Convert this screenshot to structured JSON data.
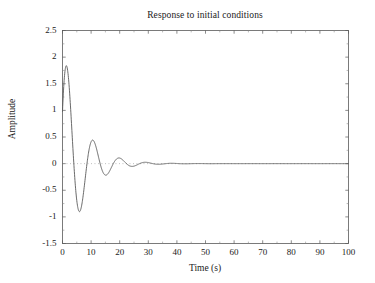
{
  "chart_data": {
    "type": "line",
    "title": "Response to initial conditions",
    "xlabel": "Time (s)",
    "ylabel": "Amplitude",
    "xlim": [
      0,
      100
    ],
    "ylim": [
      -1.5,
      2.5
    ],
    "xticks": [
      0,
      10,
      20,
      30,
      40,
      50,
      60,
      70,
      80,
      90,
      100
    ],
    "xtick_labels": [
      "0",
      "10",
      "20",
      "30",
      "40",
      "50",
      "60",
      "70",
      "80",
      "90",
      "100"
    ],
    "yticks": [
      -1.5,
      -1,
      -0.5,
      0,
      0.5,
      1,
      1.5,
      2,
      2.5
    ],
    "ytick_labels": [
      "-1.5",
      "-1",
      "-0.5",
      "0",
      "0.5",
      "1",
      "1.5",
      "2",
      "2.5"
    ],
    "grid": false,
    "legend": null,
    "zero_line": {
      "value": 0,
      "style": "dotted",
      "color": "#9a9a9a"
    },
    "line_color": "#595959",
    "line_width": 0.9,
    "background": "#ffffff",
    "series": [
      {
        "name": "response",
        "model": "damped-sinusoid",
        "amplitude": 2.32,
        "decay_rate": 0.155,
        "period": 9.2,
        "phase_deg": 25,
        "x": [
          0,
          1,
          2,
          3,
          4,
          5,
          6,
          7,
          8,
          9,
          10,
          11,
          12,
          13,
          14,
          15,
          16,
          17,
          18,
          19,
          20,
          22,
          24,
          26,
          28,
          30,
          32,
          34,
          36,
          38,
          40,
          42,
          44,
          46,
          48,
          50,
          55,
          60,
          65,
          70,
          75,
          80,
          85,
          90,
          95,
          100
        ],
        "y": [
          1.02,
          1.88,
          2.1,
          1.72,
          0.8,
          -0.42,
          -1.37,
          -1.29,
          -0.62,
          0.28,
          0.85,
          0.82,
          0.45,
          -0.1,
          -0.45,
          -0.55,
          -0.4,
          -0.05,
          0.22,
          0.34,
          0.31,
          0.0,
          -0.25,
          -0.16,
          0.13,
          0.12,
          -0.01,
          -0.11,
          -0.04,
          0.06,
          0.06,
          0.0,
          -0.04,
          -0.02,
          0.02,
          0.03,
          -0.01,
          0.0,
          0.0,
          0.0,
          0.0,
          0.0,
          0.0,
          0.0,
          0.0,
          0.0
        ],
        "peaks": [
          {
            "x": 2.0,
            "y": 2.1
          },
          {
            "x": 10.5,
            "y": 0.85
          },
          {
            "x": 19.5,
            "y": 0.35
          },
          {
            "x": 28.5,
            "y": 0.14
          },
          {
            "x": 37.5,
            "y": 0.06
          },
          {
            "x": 47.0,
            "y": 0.03
          }
        ],
        "troughs": [
          {
            "x": 6.3,
            "y": -1.37
          },
          {
            "x": 15.0,
            "y": -0.55
          },
          {
            "x": 24.0,
            "y": -0.25
          },
          {
            "x": 33.0,
            "y": -0.11
          },
          {
            "x": 42.0,
            "y": -0.05
          }
        ]
      }
    ]
  }
}
